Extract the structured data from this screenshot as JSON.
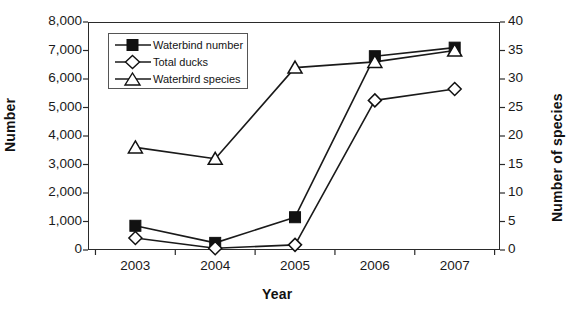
{
  "chart_data": {
    "type": "line",
    "title": "",
    "xlabel": "Year",
    "ylabel": "Number",
    "ylabel_secondary": "Number of species",
    "categories": [
      "2003",
      "2004",
      "2005",
      "2006",
      "2007"
    ],
    "ylim": [
      0,
      8000
    ],
    "ylim_secondary": [
      0,
      40
    ],
    "yticks": [
      "0",
      "1,000",
      "2,000",
      "3,000",
      "4,000",
      "5,000",
      "6,000",
      "7,000",
      "8,000"
    ],
    "yticks_secondary": [
      "0",
      "5",
      "10",
      "15",
      "20",
      "25",
      "30",
      "35",
      "40"
    ],
    "grid": false,
    "legend_position": "upper-left-inside",
    "series": [
      {
        "name": "Waterbind number",
        "axis": "left",
        "marker": "filled-square",
        "values": [
          850,
          250,
          1150,
          6800,
          7100
        ]
      },
      {
        "name": "Total ducks",
        "axis": "left",
        "marker": "open-diamond",
        "values": [
          420,
          60,
          180,
          5250,
          5650
        ]
      },
      {
        "name": "Waterbird species",
        "axis": "right",
        "marker": "open-triangle",
        "values": [
          18,
          16,
          32,
          33,
          35
        ]
      }
    ]
  },
  "axes": {
    "left_title": "Number",
    "right_title": "Number of species",
    "x_title": "Year"
  },
  "legend": {
    "items": [
      {
        "label": "Waterbind number"
      },
      {
        "label": "Total ducks"
      },
      {
        "label": "Waterbird species"
      }
    ]
  },
  "colors": {
    "line": "#1a1a1a",
    "marker_fill": "#111111",
    "marker_open": "#ffffff",
    "frame": "#2a2a2a",
    "background": "#ffffff"
  }
}
